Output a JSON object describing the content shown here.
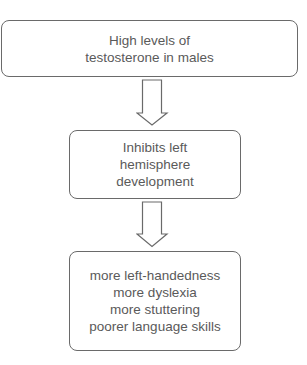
{
  "diagram": {
    "type": "flowchart",
    "direction": "top-to-bottom",
    "nodes": [
      {
        "id": "testosterone",
        "lines": [
          "High levels of",
          "testosterone in males"
        ]
      },
      {
        "id": "inhibits",
        "lines": [
          "Inhibits left",
          "hemisphere",
          "development"
        ]
      },
      {
        "id": "outcomes",
        "lines": [
          "more left-handedness",
          "more dyslexia",
          "more stuttering",
          "poorer language skills"
        ]
      }
    ],
    "edges": [
      {
        "from": "testosterone",
        "to": "inhibits",
        "icon": "arrow-down-icon"
      },
      {
        "from": "inhibits",
        "to": "outcomes",
        "icon": "arrow-down-icon"
      }
    ],
    "colors": {
      "border": "#6a6a6a",
      "text": "#5a5a5a",
      "background": "#ffffff"
    }
  }
}
